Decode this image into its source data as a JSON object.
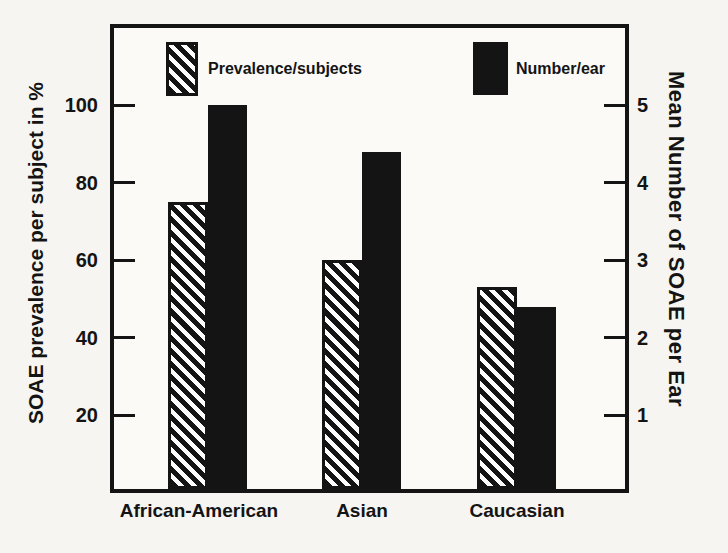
{
  "figure": {
    "background": "#f6f5f1",
    "ink": "#141414",
    "paper": "#fdfdfd"
  },
  "chart_data": {
    "type": "bar",
    "title": "",
    "categories": [
      "African-American",
      "Asian",
      "Caucasian"
    ],
    "series": [
      {
        "name": "Prevalence/subjects",
        "style": "hatched",
        "axis": "left",
        "values": [
          75,
          60,
          53
        ]
      },
      {
        "name": "Number/ear",
        "style": "solid",
        "axis": "right",
        "values": [
          5.0,
          4.4,
          2.4
        ]
      }
    ],
    "left_axis": {
      "label": "SOAE prevalence per subject in %",
      "ticks": [
        100,
        80,
        60,
        40,
        20
      ],
      "range": [
        0,
        121
      ]
    },
    "right_axis": {
      "label": "Mean Number of SOAE per Ear",
      "ticks": [
        5,
        4,
        3,
        2,
        1
      ],
      "range": [
        0,
        6.05
      ]
    },
    "legend": [
      {
        "label": "Prevalence/subjects",
        "swatch": "hatched"
      },
      {
        "label": "Number/ear",
        "swatch": "solid"
      }
    ],
    "grid": false,
    "legend_position": "top-inside"
  }
}
